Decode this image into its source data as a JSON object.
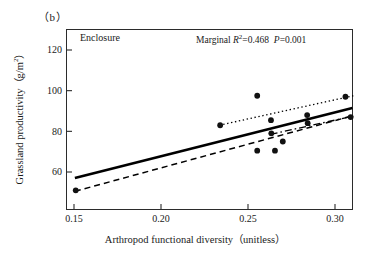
{
  "panel": {
    "label": "（b）"
  },
  "group_label": "Enclosure",
  "annotation": {
    "prefix": "Marginal ",
    "r2_symbol": "R",
    "r2_exp": "2",
    "r2_value": "=0.468",
    "p_symbol": "P",
    "p_value": "=0.001",
    "full_text": "Marginal R2=0.468  P=0.001"
  },
  "axis_titles": {
    "x_main": "Arthropod functional diversity（unitless）",
    "y_main": "Grassland productivity（g/m",
    "y_exp": "2",
    "y_tail": "）"
  },
  "ticks": {
    "y": [
      "120",
      "100",
      "80",
      "60"
    ],
    "x": [
      "0.15",
      "0.20",
      "0.25",
      "0.30"
    ]
  },
  "colors": {
    "axis": "#2b2b2b",
    "marker": "#111111",
    "fit_solid": "#000000",
    "fit_dotted": "#1a1a1a",
    "fit_dashed": "#1a1a1a",
    "background": "#ffffff"
  },
  "chart_data": {
    "type": "scatter",
    "title": "",
    "xlabel": "Arthropod functional diversity (unitless)",
    "ylabel": "Grassland productivity (g/m2)",
    "xlim": [
      0.1355,
      0.1355
    ],
    "x_range": [
      0.135,
      0.3
    ],
    "y_range": [
      50,
      128
    ],
    "xticks": [
      0.15,
      0.2,
      0.25,
      0.3
    ],
    "yticks": [
      60,
      80,
      100,
      120
    ],
    "grid": false,
    "legend": false,
    "points": [
      {
        "x": 0.151,
        "y": 51.0
      },
      {
        "x": 0.234,
        "y": 83.0
      },
      {
        "x": 0.2553,
        "y": 97.5
      },
      {
        "x": 0.2553,
        "y": 70.5
      },
      {
        "x": 0.2632,
        "y": 85.5
      },
      {
        "x": 0.2634,
        "y": 79.0
      },
      {
        "x": 0.2655,
        "y": 70.5
      },
      {
        "x": 0.27,
        "y": 75.0
      },
      {
        "x": 0.284,
        "y": 88.0
      },
      {
        "x": 0.2843,
        "y": 84.0
      },
      {
        "x": 0.306,
        "y": 97.0
      },
      {
        "x": 0.309,
        "y": 87.0
      }
    ],
    "series": [
      {
        "name": "overall fit",
        "style": "solid",
        "width": 2.6,
        "x": [
          0.1505,
          0.31
        ],
        "y": [
          57.0,
          91.5
        ]
      },
      {
        "name": "upper trend",
        "style": "dotted",
        "width": 1.3,
        "x": [
          0.2335,
          0.3105
        ],
        "y": [
          83.0,
          97.5
        ]
      },
      {
        "name": "lower trend",
        "style": "dashed",
        "width": 1.5,
        "x": [
          0.1505,
          0.3095
        ],
        "y": [
          50.5,
          87.5
        ]
      },
      {
        "name": "dash-dot trend",
        "style": "dashdot",
        "width": 1.3,
        "x": [
          0.263,
          0.3105
        ],
        "y": [
          78.5,
          87.5
        ]
      }
    ]
  }
}
